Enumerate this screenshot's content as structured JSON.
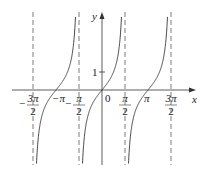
{
  "chart_data": {
    "type": "line",
    "title": "",
    "function": "y = tan x",
    "xlabel": "x",
    "ylabel": "y",
    "origin_label": "0",
    "x_ticks": [
      {
        "value": -4.712,
        "num": "3π",
        "den": "2",
        "sign": "−"
      },
      {
        "value": -3.1416,
        "label": "−π"
      },
      {
        "value": -1.5708,
        "num": "π",
        "den": "2",
        "sign": "−"
      },
      {
        "value": 1.5708,
        "num": "π",
        "den": "2",
        "sign": ""
      },
      {
        "value": 3.1416,
        "label": "π"
      },
      {
        "value": 4.712,
        "num": "3π",
        "den": "2",
        "sign": ""
      }
    ],
    "y_ticks": [
      {
        "value": 1,
        "label": "1"
      }
    ],
    "asymptotes": [
      -4.712,
      -1.5708,
      1.5708,
      4.712
    ],
    "asymptote_style": "dashed",
    "xlim": [
      -5.2,
      5.9
    ],
    "ylim": [
      -6.5,
      6.5
    ],
    "grid": false,
    "legend": null
  }
}
